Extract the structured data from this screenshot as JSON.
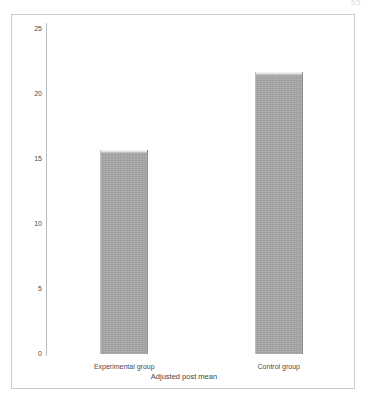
{
  "figure": {
    "page_marker": "55",
    "frame_color": "#c9ccd2",
    "background_color": "#ffffff",
    "bar_color": "#a9a9a9",
    "bar_highlight_color": "#f2f2f2",
    "text_color": "#4a4a4a"
  },
  "chart_data": {
    "type": "bar",
    "title": "",
    "subtitle": "",
    "xlabel": "Adjusted post mean",
    "ylabel": "",
    "categories": [
      "Experimental group",
      "Control group"
    ],
    "values": [
      15.7,
      21.7
    ],
    "ylim": [
      0,
      25
    ],
    "y_ticks": [
      0,
      5,
      10,
      15,
      20,
      25
    ],
    "y_tick_labels": [
      "0",
      "5",
      "10",
      "15",
      "20",
      "25"
    ],
    "grid": false,
    "legend": null,
    "legend_position": "none",
    "annotations": []
  }
}
